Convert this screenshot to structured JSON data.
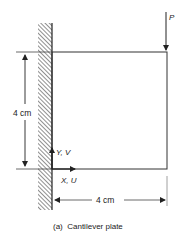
{
  "figure": {
    "caption": "(a)  Cantilever plate",
    "load_label": "P",
    "height_dimension": "4 cm",
    "width_dimension": "4 cm",
    "y_axis_label": "Y, V",
    "x_axis_label": "X, U"
  },
  "colors": {
    "line": "#222222",
    "hatch": "#333333",
    "background": "#ffffff"
  }
}
